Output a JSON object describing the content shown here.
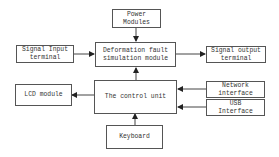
{
  "diagram": {
    "nodes": {
      "power": {
        "label": "Power\nModules"
      },
      "signal_input": {
        "label": "Signal Input\nterminal"
      },
      "deformation": {
        "label": "Deformation fault\nsimulation module"
      },
      "signal_output": {
        "label": "Signal output\nterminal"
      },
      "lcd": {
        "label": "LCD module"
      },
      "control": {
        "label": "The control unit"
      },
      "network": {
        "label": "Network\ninterface"
      },
      "usb": {
        "label": "USB\nInterface"
      },
      "keyboard": {
        "label": "Keyboard"
      }
    },
    "edges": [
      {
        "from": "power",
        "to": "deformation"
      },
      {
        "from": "signal_input",
        "to": "deformation"
      },
      {
        "from": "deformation",
        "to": "signal_output"
      },
      {
        "from": "control",
        "to": "deformation"
      },
      {
        "from": "control",
        "to": "lcd"
      },
      {
        "from": "network",
        "to": "control"
      },
      {
        "from": "usb",
        "to": "control"
      },
      {
        "from": "keyboard",
        "to": "control"
      }
    ]
  }
}
